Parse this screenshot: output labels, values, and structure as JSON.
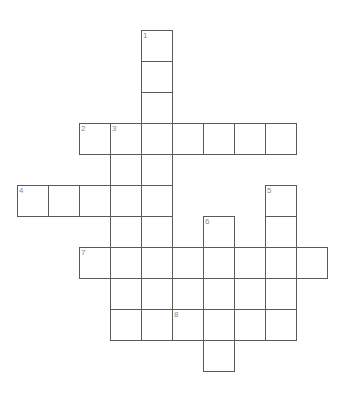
{
  "puzzle": {
    "title": "crossword-grid",
    "cell_size": 31,
    "grid_origin": {
      "x": 17,
      "y": 30
    },
    "colors": {
      "cell_border": "#5a5a5a",
      "cell_fill": "#ffffff",
      "number_text": "#8a8a8a",
      "page_background": "#ffffff"
    },
    "numbers": [
      "1",
      "2",
      "3",
      "4",
      "5",
      "6",
      "7",
      "8"
    ],
    "entries": [
      {
        "number": "1",
        "direction": "down",
        "length": 3,
        "col": 4,
        "row": 0
      },
      {
        "number": "2",
        "direction": "across",
        "length": 7,
        "col": 2,
        "row": 3
      },
      {
        "number": "3",
        "direction": "down",
        "length": 7,
        "col": 3,
        "row": 3
      },
      {
        "number": "4",
        "direction": "across",
        "length": 5,
        "col": 0,
        "row": 5
      },
      {
        "number": "5",
        "direction": "down",
        "length": 5,
        "col": 8,
        "row": 5
      },
      {
        "number": "6",
        "direction": "down",
        "length": 6,
        "col": 6,
        "row": 6
      },
      {
        "number": "7",
        "direction": "across",
        "length": 8,
        "col": 2,
        "row": 7
      },
      {
        "number": "8",
        "direction": "across",
        "length": 4,
        "col": 5,
        "row": 9
      }
    ],
    "cells": [
      {
        "col": 4,
        "row": 0,
        "number": "1",
        "letter": ""
      },
      {
        "col": 4,
        "row": 1,
        "number": "",
        "letter": ""
      },
      {
        "col": 4,
        "row": 2,
        "number": "",
        "letter": ""
      },
      {
        "col": 2,
        "row": 3,
        "number": "2",
        "letter": ""
      },
      {
        "col": 3,
        "row": 3,
        "number": "3",
        "letter": ""
      },
      {
        "col": 4,
        "row": 3,
        "number": "",
        "letter": ""
      },
      {
        "col": 5,
        "row": 3,
        "number": "",
        "letter": ""
      },
      {
        "col": 6,
        "row": 3,
        "number": "",
        "letter": ""
      },
      {
        "col": 7,
        "row": 3,
        "number": "",
        "letter": ""
      },
      {
        "col": 8,
        "row": 3,
        "number": "",
        "letter": ""
      },
      {
        "col": 3,
        "row": 4,
        "number": "",
        "letter": ""
      },
      {
        "col": 4,
        "row": 4,
        "number": "",
        "letter": ""
      },
      {
        "col": 0,
        "row": 5,
        "number": "4",
        "letter": ""
      },
      {
        "col": 1,
        "row": 5,
        "number": "",
        "letter": ""
      },
      {
        "col": 2,
        "row": 5,
        "number": "",
        "letter": ""
      },
      {
        "col": 3,
        "row": 5,
        "number": "",
        "letter": ""
      },
      {
        "col": 4,
        "row": 5,
        "number": "",
        "letter": ""
      },
      {
        "col": 8,
        "row": 5,
        "number": "5",
        "letter": ""
      },
      {
        "col": 3,
        "row": 6,
        "number": "",
        "letter": ""
      },
      {
        "col": 4,
        "row": 6,
        "number": "",
        "letter": ""
      },
      {
        "col": 6,
        "row": 6,
        "number": "6",
        "letter": ""
      },
      {
        "col": 8,
        "row": 6,
        "number": "",
        "letter": ""
      },
      {
        "col": 2,
        "row": 7,
        "number": "7",
        "letter": ""
      },
      {
        "col": 3,
        "row": 7,
        "number": "",
        "letter": ""
      },
      {
        "col": 4,
        "row": 7,
        "number": "",
        "letter": ""
      },
      {
        "col": 5,
        "row": 7,
        "number": "",
        "letter": ""
      },
      {
        "col": 6,
        "row": 7,
        "number": "",
        "letter": ""
      },
      {
        "col": 7,
        "row": 7,
        "number": "",
        "letter": ""
      },
      {
        "col": 8,
        "row": 7,
        "number": "",
        "letter": ""
      },
      {
        "col": 9,
        "row": 7,
        "number": "",
        "letter": ""
      },
      {
        "col": 3,
        "row": 8,
        "number": "",
        "letter": ""
      },
      {
        "col": 4,
        "row": 8,
        "number": "",
        "letter": ""
      },
      {
        "col": 6,
        "row": 8,
        "number": "",
        "letter": ""
      },
      {
        "col": 8,
        "row": 8,
        "number": "",
        "letter": ""
      },
      {
        "col": 3,
        "row": 9,
        "number": "",
        "letter": ""
      },
      {
        "col": 4,
        "row": 9,
        "number": "",
        "letter": ""
      },
      {
        "col": 5,
        "row": 9,
        "number": "8",
        "letter": ""
      },
      {
        "col": 6,
        "row": 9,
        "number": "",
        "letter": ""
      },
      {
        "col": 7,
        "row": 9,
        "number": "",
        "letter": ""
      },
      {
        "col": 8,
        "row": 9,
        "number": "",
        "letter": ""
      },
      {
        "col": 6,
        "row": 10,
        "number": "",
        "letter": ""
      }
    ]
  }
}
